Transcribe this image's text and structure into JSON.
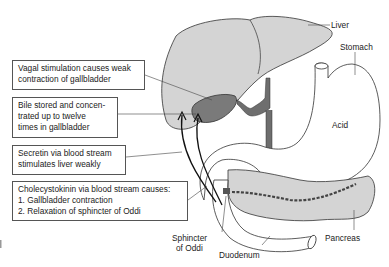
{
  "diagram": {
    "colors": {
      "organ_fill": "#d4d4d4",
      "gallbladder_fill": "#7a7a7a",
      "duct_fill": "#6e6e6e",
      "outline": "#333333"
    },
    "callouts": [
      {
        "id": "vagal",
        "lines": [
          "Vagal stimulation causes weak",
          "contraction of gallbladder"
        ]
      },
      {
        "id": "bile",
        "lines": [
          "Bile stored and concen-",
          "trated up to twelve",
          "times in gallbladder"
        ]
      },
      {
        "id": "secretin",
        "lines": [
          "Secretin via blood stream",
          "stimulates liver weakly"
        ]
      },
      {
        "id": "cck",
        "lines": [
          "Cholecystokinin via blood stream causes:",
          "1. Gallbladder contraction",
          "2. Relaxation of sphincter of Oddi"
        ]
      }
    ],
    "labels": {
      "liver": "Liver",
      "stomach": "Stomach",
      "acid": "Acid",
      "sphincter_line1": "Sphincter",
      "sphincter_line2": "of Oddi",
      "duodenum": "Duodenum",
      "pancreas": "Pancreas"
    }
  }
}
